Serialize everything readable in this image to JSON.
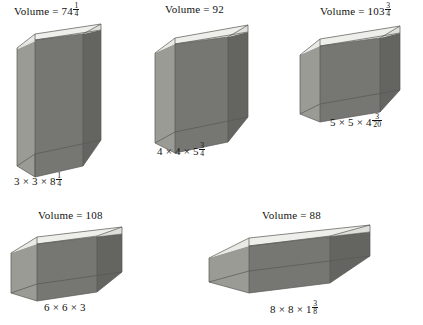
{
  "page": {
    "background": "#ffffff",
    "text_color": "#121212"
  },
  "palette": {
    "rim_top": "#e9e9e7",
    "floor": "#cfcfcb",
    "wall_left_outer": "#8e8e8a",
    "wall_left_inner": "#a3a39e",
    "wall_right_outer": "#6e6e6b",
    "wall_back_inner": "#9a9a95",
    "wall_front_inner": "#b4b4af",
    "edge": "#5a5a57"
  },
  "figures": [
    {
      "id": "box-1",
      "volume_label": "Volume = ",
      "volume_whole": "74",
      "volume_fraction": {
        "num": "1",
        "den": "4"
      },
      "dimensions_text": "3 × 3 × 8",
      "dimensions_fraction": {
        "num": "1",
        "den": "4"
      },
      "dims": {
        "w": 3,
        "d": 3,
        "h": 8.25
      },
      "volume_value": 74.25
    },
    {
      "id": "box-2",
      "volume_label": "Volume = ",
      "volume_whole": "92",
      "volume_fraction": null,
      "dimensions_text": "4 × 4 × 5",
      "dimensions_fraction": {
        "num": "3",
        "den": "4"
      },
      "dims": {
        "w": 4,
        "d": 4,
        "h": 5.75
      },
      "volume_value": 92
    },
    {
      "id": "box-3",
      "volume_label": "Volume = ",
      "volume_whole": "103",
      "volume_fraction": {
        "num": "3",
        "den": "4"
      },
      "dimensions_text": "5 × 5 × 4",
      "dimensions_fraction": {
        "num": "3",
        "den": "20"
      },
      "dims": {
        "w": 5,
        "d": 5,
        "h": 4.15
      },
      "volume_value": 103.75
    },
    {
      "id": "box-4",
      "volume_label": "Volume = ",
      "volume_whole": "108",
      "volume_fraction": null,
      "dimensions_text": "6 × 6 × 3",
      "dimensions_fraction": null,
      "dims": {
        "w": 6,
        "d": 6,
        "h": 3
      },
      "volume_value": 108
    },
    {
      "id": "box-5",
      "volume_label": "Volume = ",
      "volume_whole": "88",
      "volume_fraction": null,
      "dimensions_text": "8 × 8 × 1",
      "dimensions_fraction": {
        "num": "3",
        "den": "8"
      },
      "dims": {
        "w": 8,
        "d": 8,
        "h": 1.375
      },
      "volume_value": 88
    }
  ]
}
